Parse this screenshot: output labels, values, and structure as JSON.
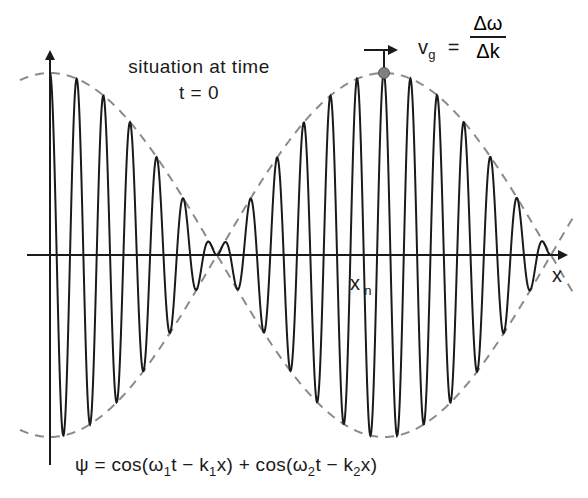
{
  "caption": {
    "line1": "situation at time",
    "line2": "t = 0"
  },
  "group_velocity": {
    "lhs": "v",
    "lhs_sub": "g",
    "equals": "=",
    "numerator": "Δω",
    "denominator": "Δk"
  },
  "axes": {
    "x_label": "x",
    "x_marker_label": "x",
    "x_marker_sub": "n"
  },
  "equation": {
    "psi": "ψ = cos(ω",
    "sub1": "1",
    "part2": "t − k",
    "sub2": "1",
    "part3": "x) + cos(ω",
    "sub3": "2",
    "part4": "t − k",
    "sub4": "2",
    "part5": "x)"
  },
  "wave": {
    "origin_x": 50,
    "axis_y": 255,
    "amplitude": 182,
    "carrier_period_px": 26.7,
    "envelope_half_period_px": 334,
    "x_end": 552,
    "stroke": "#1a1a1a",
    "envelope_stroke": "#8a8a8a",
    "marker_fill": "#808080",
    "marker_x": 384
  },
  "colors": {
    "background": "#ffffff",
    "ink": "#1a1a1a",
    "dash": "#8a8a8a"
  }
}
